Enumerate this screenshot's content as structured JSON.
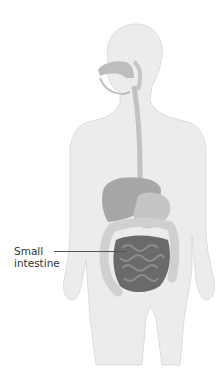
{
  "diagram": {
    "highlighted_organ": "small-intestine",
    "labels": [
      {
        "line1": "Small",
        "line2": "intestine"
      }
    ],
    "colors": {
      "background": "#ffffff",
      "body": "#ececec",
      "body_outline": "#d4d4d4",
      "organs_light": "#c8c8c8",
      "organs_mid": "#a9a9a9",
      "small_intestine": "#6a6a6a",
      "label_text": "#333333"
    }
  }
}
